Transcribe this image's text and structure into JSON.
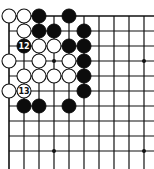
{
  "board": {
    "origin": {
      "x": 9,
      "y": 16
    },
    "spacing": 15,
    "cols": 10,
    "rows": 10,
    "left_edge": true,
    "top_edge": true,
    "extend_right_to": 154,
    "extend_bottom_to": 169,
    "stone_radius": 7,
    "colors": {
      "line": "#111111",
      "black": "#0c0c0c",
      "white": "#ffffff",
      "background": "#ffffff"
    }
  },
  "star_points": [
    {
      "col": 3,
      "row": 3
    },
    {
      "col": 9,
      "row": 3
    },
    {
      "col": 3,
      "row": 9
    },
    {
      "col": 9,
      "row": 9
    }
  ],
  "stones": [
    {
      "col": 0,
      "row": 0,
      "color": "white"
    },
    {
      "col": 1,
      "row": 0,
      "color": "white"
    },
    {
      "col": 2,
      "row": 0,
      "color": "black"
    },
    {
      "col": 4,
      "row": 0,
      "color": "black"
    },
    {
      "col": 1,
      "row": 1,
      "color": "white"
    },
    {
      "col": 2,
      "row": 1,
      "color": "black"
    },
    {
      "col": 3,
      "row": 1,
      "color": "black"
    },
    {
      "col": 5,
      "row": 1,
      "color": "black"
    },
    {
      "col": 1,
      "row": 2,
      "color": "black",
      "label": "12"
    },
    {
      "col": 2,
      "row": 2,
      "color": "white"
    },
    {
      "col": 3,
      "row": 2,
      "color": "white"
    },
    {
      "col": 4,
      "row": 2,
      "color": "black"
    },
    {
      "col": 5,
      "row": 2,
      "color": "black"
    },
    {
      "col": 0,
      "row": 3,
      "color": "white"
    },
    {
      "col": 2,
      "row": 3,
      "color": "white"
    },
    {
      "col": 4,
      "row": 3,
      "color": "white"
    },
    {
      "col": 5,
      "row": 3,
      "color": "black"
    },
    {
      "col": 1,
      "row": 4,
      "color": "white"
    },
    {
      "col": 2,
      "row": 4,
      "color": "white"
    },
    {
      "col": 3,
      "row": 4,
      "color": "white"
    },
    {
      "col": 4,
      "row": 4,
      "color": "white"
    },
    {
      "col": 5,
      "row": 4,
      "color": "black"
    },
    {
      "col": 0,
      "row": 5,
      "color": "white"
    },
    {
      "col": 1,
      "row": 5,
      "color": "white",
      "label": "13"
    },
    {
      "col": 5,
      "row": 5,
      "color": "black"
    },
    {
      "col": 1,
      "row": 6,
      "color": "black"
    },
    {
      "col": 2,
      "row": 6,
      "color": "black"
    },
    {
      "col": 4,
      "row": 6,
      "color": "black"
    }
  ]
}
